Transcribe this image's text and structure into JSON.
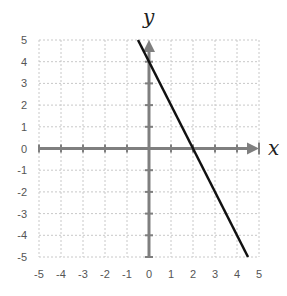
{
  "chart_data": {
    "type": "line",
    "title": "",
    "xlabel": "x",
    "ylabel": "y",
    "xlim": [
      -5,
      5
    ],
    "ylim": [
      -5,
      5
    ],
    "grid": true,
    "x_ticks": [
      -5,
      -4,
      -3,
      -2,
      -1,
      0,
      1,
      2,
      3,
      4,
      5
    ],
    "y_ticks": [
      5,
      4,
      3,
      2,
      1,
      0,
      -1,
      -2,
      -3,
      -4,
      -5
    ],
    "series": [
      {
        "name": "y = -2x + 4",
        "x": [
          -0.5,
          4.5
        ],
        "y": [
          5,
          -5
        ],
        "color": "#111111"
      }
    ],
    "colors": {
      "grid": "#c8c8c8",
      "axis": "#7f7f7f",
      "line": "#111111"
    }
  }
}
